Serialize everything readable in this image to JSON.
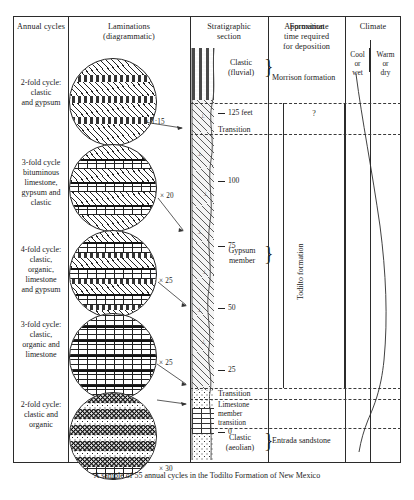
{
  "figure": {
    "caption": "A sample of 55 annual cycles in the Todilto Formation of New Mexico",
    "columns": [
      {
        "id": "annual-cycles",
        "title": "Annual cycles"
      },
      {
        "id": "laminations",
        "title": "Laminations",
        "subtitle": "(diagrammatic)"
      },
      {
        "id": "stratigraphic-section",
        "title": "Stratigraphic",
        "subtitle": "section"
      },
      {
        "id": "formation",
        "title": "Formation"
      },
      {
        "id": "approximate-time",
        "title": "Approximate",
        "subtitle": "time required",
        "subtitle2": "for deposition"
      },
      {
        "id": "climate",
        "title": "Climate"
      }
    ],
    "climate_scale": {
      "left": "Cool\nor\nwet",
      "left_l1": "Cool",
      "left_l2": "or",
      "left_l3": "wet",
      "right_l1": "Warm",
      "right_l2": "or",
      "right_l3": "dry"
    },
    "cycles": [
      {
        "id": "cycle-2fold-gypsum",
        "label_l1": "2-fold cycle:",
        "label_l2": "clastic",
        "label_l3": "and gypsum",
        "magnification": "× 1:15"
      },
      {
        "id": "cycle-3fold-bituminous",
        "label_l1": "3-fold cycle",
        "label_l2": "bituminous",
        "label_l3": "limestone,",
        "label_l4": "gypsum and",
        "label_l5": "clastic",
        "magnification": "× 20"
      },
      {
        "id": "cycle-4fold",
        "label_l1": "4-fold cycle:",
        "label_l2": "clastic,",
        "label_l3": "organic,",
        "label_l4": "limestone",
        "label_l5": "and gypsum",
        "magnification": "× 25"
      },
      {
        "id": "cycle-3fold-limestone",
        "label_l1": "3-fold cycle:",
        "label_l2": "clastic,",
        "label_l3": "organic and",
        "label_l4": "limestone",
        "magnification": "× 25"
      },
      {
        "id": "cycle-2fold-organic",
        "label_l1": "2-fold cycle:",
        "label_l2": "clastic and",
        "label_l3": "organic",
        "magnification": "× 30"
      }
    ],
    "depth_scale": {
      "unit": "feet",
      "ticks": [
        {
          "value": "125 feet"
        },
        {
          "value": "100"
        },
        {
          "value": "75"
        },
        {
          "value": "50"
        },
        {
          "value": "25"
        },
        {
          "value": "0"
        }
      ]
    },
    "section_labels": [
      {
        "id": "clastic-fluvial",
        "l1": "Clastic",
        "l2": "(fluvial)"
      },
      {
        "id": "transition-upper",
        "l1": "Transition"
      },
      {
        "id": "gypsum-member",
        "l1": "Gypsum",
        "l2": "member"
      },
      {
        "id": "transition-lower",
        "l1": "Transition"
      },
      {
        "id": "limestone-member-transition",
        "l1": "Limestone",
        "l2": "member",
        "l3": "transition"
      },
      {
        "id": "clastic-aeolian",
        "l1": "Clastic",
        "l2": "(aeolian)"
      }
    ],
    "formations": [
      {
        "id": "morrison-formation",
        "label": "Morrison formation"
      },
      {
        "id": "todilto-formation",
        "label": "Todilto formation"
      },
      {
        "id": "entrada-sandstone",
        "label": "Entrada sandstone"
      }
    ],
    "time_required": {
      "unknown_marker": "?"
    },
    "colors": {
      "ink": "#1b1b1b",
      "rule": "#2b2b2b",
      "dash": "#3a3a3a"
    }
  }
}
